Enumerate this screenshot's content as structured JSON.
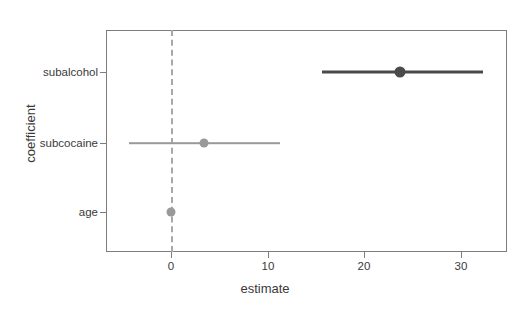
{
  "chart_data": {
    "type": "scatter",
    "subtype": "coefficient-forest-plot",
    "title": "",
    "xlabel": "estimate",
    "ylabel": "coefficient",
    "xlim": [
      -6.7,
      34.7
    ],
    "xticks": [
      0,
      10,
      20,
      30
    ],
    "xticklabels": [
      "0",
      "10",
      "20",
      "30"
    ],
    "categories": [
      "subalcohol",
      "subcocaine",
      "age"
    ],
    "grid": false,
    "legend": null,
    "reference_line": {
      "value": 0,
      "style": "dashed",
      "color": "#a8a8a8"
    },
    "points": [
      {
        "coefficient": "subalcohol",
        "estimate": 23.7,
        "conf_low": 15.6,
        "conf_high": 32.3,
        "color": "#4a4a4a",
        "size": "large"
      },
      {
        "coefficient": "subcocaine",
        "estimate": 3.4,
        "conf_low": -4.3,
        "conf_high": 11.3,
        "color": "#999999",
        "size": "medium"
      },
      {
        "coefficient": "age",
        "estimate": 0.0,
        "conf_low": -0.2,
        "conf_high": 0.2,
        "color": "#999999",
        "size": "medium"
      }
    ]
  },
  "axes": {
    "x_title": "estimate",
    "y_title": "coefficient",
    "x_tick_labels": [
      "0",
      "10",
      "20",
      "30"
    ],
    "y_tick_labels": [
      "subalcohol",
      "subcocaine",
      "age"
    ]
  }
}
